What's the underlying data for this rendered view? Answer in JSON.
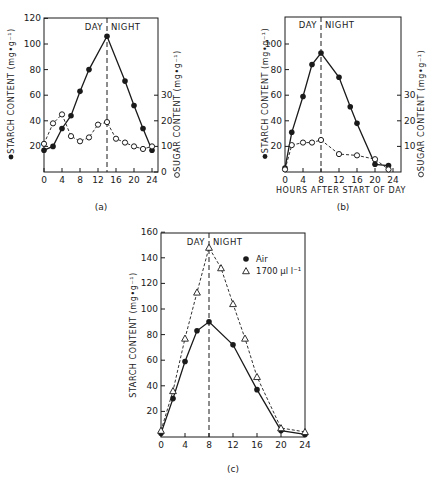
{
  "chart_data": [
    {
      "id": "a",
      "type": "line",
      "panel_label": "(a)",
      "title": "",
      "xlabel": "",
      "ylabel": "STARCH CONTENT (mg•g⁻¹)",
      "ylabel_right": "SUGAR CONTENT (mg•g⁻¹)",
      "x_ticks": [
        0,
        4,
        8,
        12,
        16,
        20,
        24
      ],
      "y_ticks": [
        20,
        40,
        60,
        80,
        100,
        120
      ],
      "y_right_ticks": [
        0,
        10,
        20,
        30
      ],
      "xlim": [
        0,
        24
      ],
      "ylim": [
        0,
        120
      ],
      "ylim_right": [
        0,
        60
      ],
      "divider_x": 14,
      "divider_labels": [
        "DAY",
        "NIGHT"
      ],
      "grid": false,
      "series": [
        {
          "name": "Starch",
          "marker": "filled-circle",
          "line": "solid",
          "axis": "left",
          "x": [
            0,
            2,
            4,
            6,
            8,
            10,
            14,
            18,
            20,
            22,
            24
          ],
          "values": [
            17,
            20,
            34,
            44,
            63,
            80,
            106,
            71,
            52,
            34,
            17
          ]
        },
        {
          "name": "Sugar",
          "marker": "open-circle",
          "line": "dashed",
          "axis": "right",
          "x": [
            0,
            2,
            4,
            6,
            8,
            10,
            12,
            14,
            16,
            18,
            20,
            22,
            24
          ],
          "values": [
            11,
            19,
            22.5,
            14,
            12,
            13.5,
            18.5,
            19.5,
            13,
            11.5,
            10,
            9,
            10
          ]
        }
      ]
    },
    {
      "id": "b",
      "type": "line",
      "panel_label": "(b)",
      "title": "",
      "xlabel": "HOURS AFTER START OF DAY",
      "ylabel": "STARCH CONTENT (mg•g⁻¹)",
      "ylabel_right": "SUGAR CONTENT (mg•g⁻¹)",
      "x_ticks": [
        0,
        4,
        8,
        12,
        16,
        20,
        24
      ],
      "y_ticks": [
        20,
        40,
        60,
        80,
        100
      ],
      "y_right_ticks": [
        10,
        20,
        30
      ],
      "xlim": [
        0,
        24
      ],
      "ylim": [
        0,
        120
      ],
      "ylim_right": [
        0,
        60
      ],
      "divider_x": 8,
      "divider_labels": [
        "DAY",
        "NIGHT"
      ],
      "grid": false,
      "series": [
        {
          "name": "Starch",
          "marker": "filled-circle",
          "line": "solid",
          "axis": "left",
          "x": [
            0,
            1.5,
            4,
            6,
            8,
            12,
            14.5,
            16,
            20,
            23
          ],
          "values": [
            3,
            31,
            59,
            84,
            93,
            74,
            51,
            38,
            6,
            5
          ]
        },
        {
          "name": "Sugar",
          "marker": "open-circle",
          "line": "dashed",
          "axis": "right",
          "x": [
            0,
            1.5,
            4,
            6,
            8,
            12,
            16,
            20,
            23
          ],
          "values": [
            1,
            10.5,
            11.5,
            11.5,
            12.5,
            7,
            6.5,
            5,
            1
          ]
        }
      ]
    },
    {
      "id": "c",
      "type": "line",
      "panel_label": "(c)",
      "title": "",
      "xlabel": "",
      "ylabel": "STARCH CONTENT (mg•g⁻¹)",
      "x_ticks": [
        0,
        4,
        8,
        12,
        16,
        20,
        24
      ],
      "y_ticks": [
        20,
        40,
        60,
        80,
        100,
        120,
        140,
        160
      ],
      "xlim": [
        0,
        24
      ],
      "ylim": [
        0,
        160
      ],
      "divider_x": 8,
      "divider_labels": [
        "DAY",
        "NIGHT"
      ],
      "legend_position": "upper right",
      "grid": false,
      "series": [
        {
          "name": "Air",
          "marker": "filled-circle",
          "line": "solid",
          "x": [
            0,
            2,
            4,
            6,
            8,
            12,
            16,
            20,
            24
          ],
          "values": [
            3,
            30,
            59,
            83,
            90,
            72,
            37,
            5,
            2
          ]
        },
        {
          "name": "1700 µl l⁻¹",
          "marker": "open-triangle",
          "line": "dashed",
          "x": [
            0,
            2,
            4,
            6,
            8,
            10,
            12,
            14,
            16,
            20,
            24
          ],
          "values": [
            5,
            36,
            77,
            113,
            148,
            132,
            104,
            77,
            47,
            7,
            4
          ]
        }
      ]
    }
  ]
}
